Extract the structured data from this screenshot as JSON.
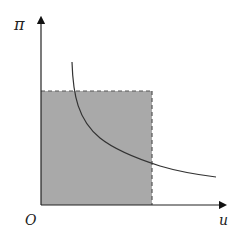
{
  "diagram": {
    "y_axis_label": "π",
    "x_axis_label": "u",
    "origin_label": "O",
    "colors": {
      "axis": "#222222",
      "shaded_region": "#a9a9a9",
      "dashed_border": "#555555",
      "curve": "#333333",
      "background": "#ffffff"
    },
    "elements": {
      "shaded_rectangle": {
        "x0": 41,
        "y0": 91,
        "x1": 152,
        "y1": 205,
        "border_style": "dashed (top and right)"
      },
      "curve": {
        "type": "decreasing convex (hyperbola-like)",
        "start": [
          72,
          62
        ],
        "end": [
          216,
          177
        ]
      }
    }
  }
}
